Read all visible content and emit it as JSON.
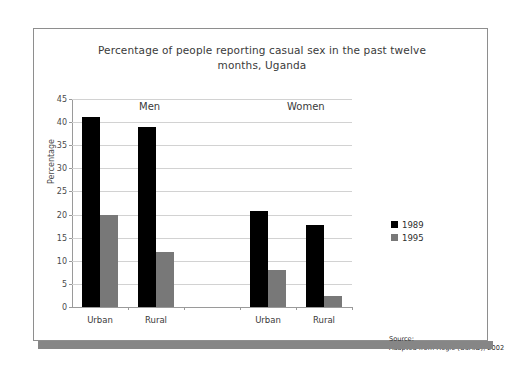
{
  "chart_data": {
    "type": "bar",
    "title": "Percentage of people reporting casual sex in the past twelve months, Uganda",
    "title_line1": "Percentage of people reporting casual sex in the past twelve",
    "title_line2": "months, Uganda",
    "xlabel": "",
    "ylabel": "Percentage",
    "ylim": [
      0,
      45
    ],
    "ytick_step": 5,
    "yticks": [
      0,
      5,
      10,
      15,
      20,
      25,
      30,
      35,
      40,
      45
    ],
    "ytick_labels": [
      "0",
      "5",
      "10",
      "15",
      "20",
      "25",
      "30",
      "35",
      "40",
      "45"
    ],
    "grid": true,
    "legend_position": "right",
    "categories": [
      "Urban",
      "Rural",
      "",
      "Urban",
      "Rural"
    ],
    "group_labels": [
      "Men",
      "Women"
    ],
    "series": [
      {
        "name": "1989",
        "color": "#000000",
        "values": [
          41.2,
          39.0,
          null,
          20.8,
          17.8
        ]
      },
      {
        "name": "1995",
        "color": "#787878",
        "values": [
          20.0,
          12.0,
          null,
          8.0,
          2.3
        ]
      }
    ],
    "annotations": {
      "source_line1": "Source:",
      "source_line2": "Adapted from Hogle (USAID), 2002"
    }
  },
  "legend": {
    "items": [
      {
        "label": "1989",
        "color": "#000000"
      },
      {
        "label": "1995",
        "color": "#787878"
      }
    ]
  },
  "colors": {
    "series_1989": "#000000",
    "series_1995": "#787878",
    "frame_border": "#8e8e8e",
    "shadow_bar": "#868686",
    "gridline": "#d2d2d2",
    "axis_line": "#9a9a9a",
    "text": "#3a3a3a",
    "background": "#ffffff"
  }
}
